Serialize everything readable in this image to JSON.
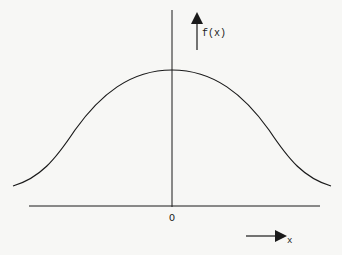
{
  "figure": {
    "type": "bell-curve",
    "y_axis_label": "f(x)",
    "x_axis_label": "x",
    "origin_label": "O",
    "curve": {
      "description": "symmetric bell-shaped (normal distribution) curve centered at origin",
      "peak_x": 0,
      "path": "M 13 186 C 40 178, 55 160, 75 130 C 100 95, 130 70, 172 70 C 214 70, 244 95, 269 130 C 289 160, 304 178, 331 186"
    },
    "colors": {
      "background": "#f7f7f5",
      "ink": "#1a1a1a"
    }
  }
}
